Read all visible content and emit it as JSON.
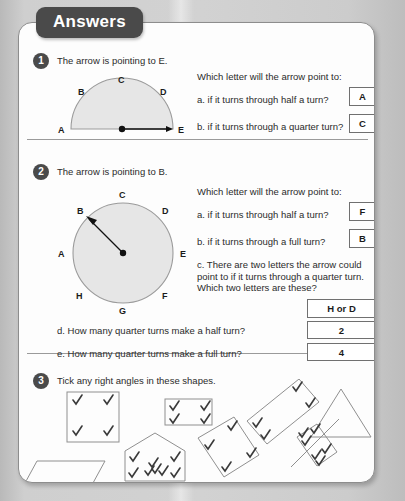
{
  "header": {
    "tab_label": "Answers"
  },
  "questions": [
    {
      "number": "1",
      "stem": "The arrow is pointing to E.",
      "prompt": "Which letter will the arrow point to:",
      "items": [
        {
          "label": "a. if it turns through half a turn?",
          "answer": "A"
        },
        {
          "label": "b. if it turns through a quarter turn?",
          "answer": "C"
        }
      ],
      "diagram": {
        "type": "semicircle-dial",
        "labels": [
          "A",
          "B",
          "C",
          "D",
          "E"
        ],
        "arrow_points_to": "E"
      }
    },
    {
      "number": "2",
      "stem": "The arrow is pointing to B.",
      "prompt": "Which letter will the arrow point to:",
      "items": [
        {
          "label": "a. if it turns through half a turn?",
          "answer": "F"
        },
        {
          "label": "b. if it turns through a full turn?",
          "answer": "B"
        },
        {
          "label": "c. There are two letters the arrow could point to if it turns through a quarter turn. Which two letters are these?",
          "answer": "H or D"
        },
        {
          "label": "d. How many quarter turns make a half turn?",
          "answer": "2"
        },
        {
          "label": "e. How many quarter turns make a full turn?",
          "answer": "4"
        }
      ],
      "diagram": {
        "type": "circle-dial",
        "labels": [
          "A",
          "B",
          "C",
          "D",
          "E",
          "F",
          "G",
          "H"
        ],
        "arrow_points_to": "B"
      }
    },
    {
      "number": "3",
      "stem": "Tick any right angles in these shapes.",
      "shapes": [
        {
          "name": "square",
          "ticks": 4
        },
        {
          "name": "parallelogram",
          "ticks": 0
        },
        {
          "name": "house-pentagon",
          "ticks": 4
        },
        {
          "name": "rectangle",
          "ticks": 4
        },
        {
          "name": "tilted-square",
          "ticks": 4
        },
        {
          "name": "tilted-rectangle-large",
          "ticks": 4
        },
        {
          "name": "tilted-rectangle-small",
          "ticks": 4
        },
        {
          "name": "triangle",
          "ticks": 0
        }
      ]
    }
  ],
  "colors": {
    "tab_background": "#4a4a4a",
    "card_background": "#fdfdfd",
    "page_background": "#c9c9c9",
    "dial_fill": "#e6e6e6",
    "text": "#2b2b2b",
    "box_border": "#707070"
  }
}
